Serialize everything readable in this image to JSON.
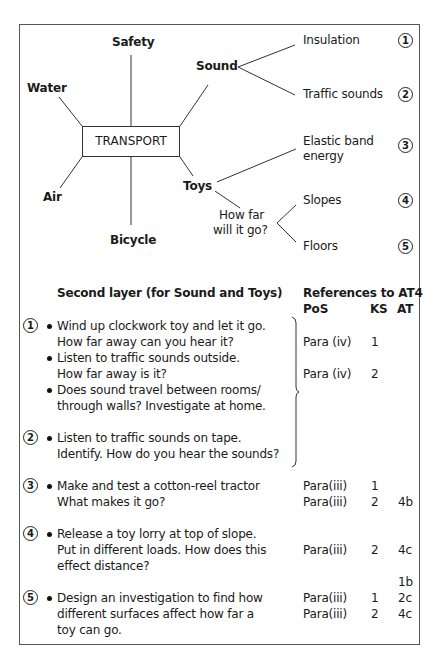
{
  "mindmap": {
    "center": "TRANSPORT",
    "branches": [
      "Safety",
      "Water",
      "Air",
      "Bicycle",
      "Sound",
      "Toys"
    ],
    "sound_children": [
      {
        "label": "Insulation",
        "num": "1"
      },
      {
        "label": "Traffic sounds",
        "num": "2"
      }
    ],
    "toys_children": [
      {
        "label_line1": "Elastic band",
        "label_line2": "energy",
        "num": "3"
      },
      {
        "label_line1": "How far",
        "label_line2": "will it go?"
      }
    ],
    "howfar_children": [
      {
        "label": "Slopes",
        "num": "4"
      },
      {
        "label": "Floors",
        "num": "5"
      }
    ]
  },
  "second_layer": {
    "heading": "Second layer (for Sound and Toys)",
    "ref_heading": "References to AT4",
    "col_pos": "PoS",
    "col_ks": "KS",
    "col_at": "AT",
    "items": [
      {
        "num": "1",
        "bullets": [
          {
            "l1": "Wind up clockwork toy and let it go.",
            "l2": "How far away can you hear it?"
          },
          {
            "l1": "Listen to traffic sounds outside.",
            "l2": "How far away is it?"
          },
          {
            "l1": "Does sound travel between rooms/",
            "l2": "through walls? Investigate at home."
          }
        ]
      },
      {
        "num": "2",
        "bullets": [
          {
            "l1": "Listen to traffic sounds on tape.",
            "l2": "Identify. How do you hear the sounds?"
          }
        ]
      },
      {
        "num": "3",
        "bullets": [
          {
            "l1": "Make and test a cotton-reel tractor",
            "l2": "What makes it go?"
          }
        ]
      },
      {
        "num": "4",
        "bullets": [
          {
            "l1": "Release a toy lorry at top of slope.",
            "l2": "Put in different loads. How does this",
            "l3": "effect distance?"
          }
        ]
      },
      {
        "num": "5",
        "bullets": [
          {
            "l1": "Design an investigation to find how",
            "l2": "different surfaces affect how far a",
            "l3": "toy can go."
          }
        ]
      }
    ],
    "refs": [
      {
        "pos": "Para (iv)",
        "ks": "1",
        "at": ""
      },
      {
        "pos": "Para (iv)",
        "ks": "2",
        "at": ""
      },
      {
        "pos": "Para(iii)",
        "ks": "1",
        "at": ""
      },
      {
        "pos": "Para(iii)",
        "ks": "2",
        "at": "4b"
      },
      {
        "pos": "Para(iii)",
        "ks": "2",
        "at": "4c"
      },
      {
        "pos": "",
        "ks": "",
        "at": "1b"
      },
      {
        "pos": "Para(iii)",
        "ks": "1",
        "at": "2c"
      },
      {
        "pos": "Para(iii)",
        "ks": "2",
        "at": "4c"
      }
    ]
  }
}
